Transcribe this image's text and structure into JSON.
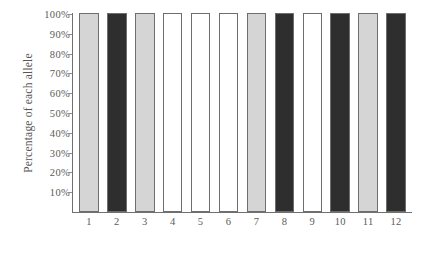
{
  "chart_data": {
    "type": "bar",
    "title": "",
    "subtitle": "",
    "xlabel": "",
    "ylabel": "Percentage of each allele",
    "categories": [
      "1",
      "2",
      "3",
      "4",
      "5",
      "6",
      "7",
      "8",
      "9",
      "10",
      "11",
      "12"
    ],
    "values": [
      100,
      100,
      100,
      100,
      100,
      100,
      100,
      100,
      100,
      100,
      100,
      100
    ],
    "bar_fills": [
      "light-gray",
      "dark-gray",
      "light-gray",
      "white",
      "white",
      "white",
      "light-gray",
      "dark-gray",
      "white",
      "dark-gray",
      "light-gray",
      "dark-gray"
    ],
    "ytick_labels": [
      "100%",
      "90%",
      "80%",
      "70%",
      "60%",
      "50%",
      "40%",
      "30%",
      "20%",
      "10%"
    ],
    "ytick_values": [
      100,
      90,
      80,
      70,
      60,
      50,
      40,
      30,
      20,
      10
    ],
    "ylim": [
      0,
      100
    ],
    "grid": false,
    "legend": null,
    "colors": {
      "light_gray": "#d5d5d5",
      "dark_gray": "#2e2e2e",
      "white": "#ffffff",
      "bar_outline": "#6e6e6e",
      "axis": "#707070",
      "text": "#5a5a5a",
      "background": "#ffffff"
    }
  }
}
